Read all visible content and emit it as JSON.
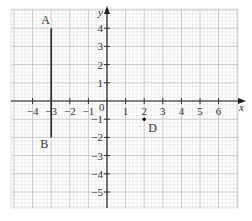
{
  "chart_data": {
    "type": "coordinate-grid",
    "title": "",
    "xlabel": "x",
    "ylabel": "y",
    "xlim": [
      -5,
      6.5
    ],
    "ylim": [
      -5.9,
      5
    ],
    "origin_label": "0",
    "x_ticks": [
      -4,
      -3,
      -2,
      -1,
      1,
      2,
      3,
      4,
      5,
      6
    ],
    "x_tick_labels": [
      "−4",
      "−3",
      "−2",
      "−1",
      "1",
      "2",
      "3",
      "4",
      "5",
      "6"
    ],
    "y_ticks": [
      4,
      3,
      2,
      1,
      -1,
      -2,
      -3,
      -4,
      -5
    ],
    "y_tick_labels": [
      "4",
      "3",
      "2",
      "1",
      "−1",
      "−2",
      "−3",
      "−4",
      "−5"
    ],
    "grid": true,
    "minor_divisions_per_unit": 5,
    "segments": [
      {
        "name": "AB",
        "from": {
          "label": "A",
          "x": -3,
          "y": 4
        },
        "to": {
          "label": "B",
          "x": -3,
          "y": -2
        }
      }
    ],
    "points": [
      {
        "label": "D",
        "x": 2,
        "y": -1
      }
    ],
    "colors": {
      "axis": "#222222",
      "major_grid": "#bdbdbd",
      "minor_grid": "#e2e2e2",
      "segment": "#333333",
      "point": "#111111"
    }
  },
  "labels": {
    "x_axis": "x",
    "y_axis": "y",
    "origin": "0",
    "A": "A",
    "B": "B",
    "D": "D"
  }
}
